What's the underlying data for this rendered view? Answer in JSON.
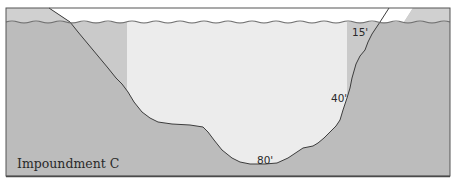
{
  "diagram": {
    "title": "Impoundment C",
    "type": "reservoir cross-section",
    "depth_labels": [
      {
        "id": "depth-15",
        "text": "15'"
      },
      {
        "id": "depth-40",
        "text": "40'"
      },
      {
        "id": "depth-80",
        "text": "80'"
      }
    ],
    "colors": {
      "sky": "#f2f2f2",
      "above_water_band": "#d3d3d3",
      "land_shade": "#b9b9b9",
      "water_light_zone": "#e9e9e9",
      "water_dark_zone": "#cfcfcf",
      "water_surface_line": "#6e6e6e",
      "shoreline": "#3c3c3c",
      "frame": "#555555"
    }
  }
}
